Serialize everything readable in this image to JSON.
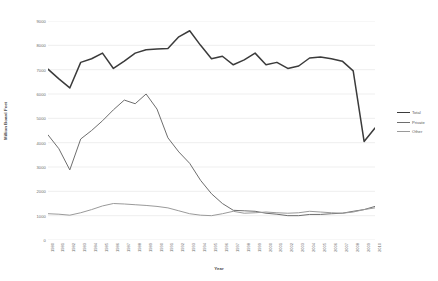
{
  "chart_data": {
    "type": "line",
    "title": "",
    "xlabel": "Year",
    "ylabel": "Million Board Feet",
    "ylim": [
      0,
      9000
    ],
    "ytick_values": [
      0,
      1000,
      2000,
      3000,
      4000,
      5000,
      6000,
      7000,
      8000,
      9000
    ],
    "ytick_labels": [
      "0",
      "1000",
      "2000",
      "3000",
      "4000",
      "5000",
      "6000",
      "7000",
      "8000",
      "9000"
    ],
    "grid": true,
    "grid_axis": "y",
    "legend_position": "right",
    "x": [
      1980,
      1981,
      1982,
      1983,
      1984,
      1985,
      1986,
      1987,
      1988,
      1989,
      1990,
      1991,
      1992,
      1993,
      1994,
      1995,
      1996,
      1997,
      1998,
      1999,
      2000,
      2001,
      2002,
      2003,
      2004,
      2005,
      2006,
      2007,
      2008,
      2009,
      2010
    ],
    "categories": [
      "1980",
      "1981",
      "1982",
      "1983",
      "1984",
      "1985",
      "1986",
      "1987",
      "1988",
      "1989",
      "1990",
      "1991",
      "1992",
      "1993",
      "1994",
      "1995",
      "1996",
      "1997",
      "1998",
      "1999",
      "2000",
      "2001",
      "2002",
      "2003",
      "2004",
      "2005",
      "2006",
      "2007",
      "2008",
      "2009",
      "2010"
    ],
    "series": [
      {
        "name": "Total",
        "color": "#3b3b3b",
        "values": [
          7020,
          6620,
          6250,
          7300,
          7450,
          7680,
          7050,
          7350,
          7680,
          7820,
          7850,
          7870,
          8350,
          8600,
          8000,
          7450,
          7550,
          7200,
          7400,
          7680,
          7200,
          7300,
          7050,
          7150,
          7480,
          7520,
          7450,
          7350,
          6950,
          4050,
          4600
        ]
      },
      {
        "name": "Private",
        "color": "#6e6e6e",
        "values": [
          4320,
          3750,
          2880,
          4150,
          4500,
          4900,
          5350,
          5750,
          5600,
          6000,
          5380,
          4200,
          3620,
          3150,
          2450,
          1900,
          1500,
          1220,
          1200,
          1180,
          1100,
          1060,
          1000,
          1000,
          1050,
          1050,
          1080,
          1100,
          1180,
          1250,
          1380
        ]
      },
      {
        "name": "Other",
        "color": "#9a9a9a",
        "values": [
          1080,
          1060,
          1020,
          1120,
          1250,
          1400,
          1500,
          1480,
          1450,
          1420,
          1380,
          1320,
          1200,
          1080,
          1020,
          1000,
          1080,
          1180,
          1100,
          1120,
          1150,
          1120,
          1100,
          1120,
          1180,
          1150,
          1120,
          1100,
          1150,
          1250,
          1320
        ]
      }
    ]
  },
  "axes": {
    "y_title": "Million Board Feet",
    "x_title": "Year"
  },
  "legend": {
    "items": [
      {
        "label": "Total",
        "color": "#3b3b3b"
      },
      {
        "label": "Private",
        "color": "#6e6e6e"
      },
      {
        "label": "Other",
        "color": "#9a9a9a"
      }
    ]
  }
}
